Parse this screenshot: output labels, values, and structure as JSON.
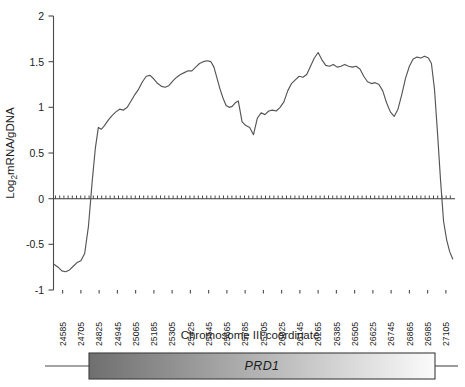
{
  "chart_data": {
    "type": "line",
    "title": "",
    "xlabel": "Chromosome III coordinate",
    "ylabel": "Log2mRNA/gDNA",
    "ylabel_base": "Log",
    "ylabel_sub": "2",
    "ylabel_rest": "mRNA/gDNA",
    "ylim": [
      -1,
      2
    ],
    "yticks": [
      -1,
      -0.5,
      0,
      0.5,
      1,
      1.5,
      2
    ],
    "ytick_labels": [
      "-1",
      "-0.5",
      "0",
      "0.5",
      "1",
      "1.5",
      "2"
    ],
    "xlim": [
      24525,
      27165
    ],
    "xticks": [
      24585,
      24705,
      24825,
      24945,
      25065,
      25185,
      25305,
      25425,
      25545,
      25665,
      25785,
      25905,
      26025,
      26145,
      26265,
      26385,
      26505,
      26625,
      26745,
      26865,
      26985,
      27105
    ],
    "xtick_labels": [
      "24585",
      "24705",
      "24825",
      "24945",
      "25065",
      "25185",
      "25305",
      "25425",
      "25545",
      "25665",
      "25785",
      "25905",
      "26025",
      "26145",
      "26265",
      "26385",
      "26505",
      "26625",
      "26745",
      "26865",
      "26985",
      "27105"
    ],
    "grid": false,
    "legend": null,
    "reference_line": {
      "y": 0,
      "style": "hatched",
      "label": "zero"
    },
    "series": [
      {
        "name": "Log2 mRNA/gDNA ratio",
        "color": "#555555",
        "x": [
          24530,
          24555,
          24580,
          24605,
          24630,
          24655,
          24680,
          24705,
          24730,
          24755,
          24780,
          24800,
          24820,
          24840,
          24860,
          24885,
          24910,
          24935,
          24960,
          24985,
          25010,
          25035,
          25060,
          25085,
          25110,
          25135,
          25160,
          25185,
          25210,
          25235,
          25260,
          25285,
          25310,
          25335,
          25360,
          25385,
          25410,
          25435,
          25460,
          25485,
          25510,
          25535,
          25560,
          25580,
          25600,
          25620,
          25640,
          25660,
          25680,
          25700,
          25720,
          25740,
          25765,
          25790,
          25815,
          25840,
          25865,
          25890,
          25915,
          25940,
          25965,
          25990,
          26015,
          26040,
          26065,
          26090,
          26115,
          26140,
          26165,
          26190,
          26215,
          26240,
          26265,
          26290,
          26315,
          26340,
          26365,
          26390,
          26415,
          26440,
          26465,
          26490,
          26515,
          26540,
          26565,
          26590,
          26615,
          26640,
          26665,
          26690,
          26715,
          26740,
          26765,
          26790,
          26815,
          26840,
          26865,
          26890,
          26915,
          26940,
          26965,
          26990,
          27010,
          27030,
          27050,
          27070,
          27090,
          27110,
          27130,
          27150
        ],
        "y": [
          -0.72,
          -0.75,
          -0.79,
          -0.8,
          -0.78,
          -0.74,
          -0.7,
          -0.68,
          -0.6,
          -0.3,
          0.2,
          0.55,
          0.78,
          0.76,
          0.8,
          0.86,
          0.91,
          0.95,
          0.98,
          0.97,
          1.0,
          1.07,
          1.14,
          1.2,
          1.28,
          1.34,
          1.35,
          1.31,
          1.26,
          1.23,
          1.22,
          1.24,
          1.29,
          1.33,
          1.36,
          1.38,
          1.4,
          1.4,
          1.44,
          1.48,
          1.5,
          1.51,
          1.5,
          1.44,
          1.32,
          1.2,
          1.1,
          1.02,
          1.0,
          1.01,
          1.05,
          1.07,
          0.84,
          0.8,
          0.78,
          0.7,
          0.88,
          0.94,
          0.92,
          0.96,
          0.97,
          0.96,
          1.0,
          1.06,
          1.18,
          1.26,
          1.3,
          1.34,
          1.33,
          1.36,
          1.45,
          1.54,
          1.6,
          1.52,
          1.46,
          1.45,
          1.47,
          1.44,
          1.45,
          1.47,
          1.45,
          1.44,
          1.45,
          1.42,
          1.34,
          1.28,
          1.26,
          1.27,
          1.25,
          1.18,
          1.05,
          0.95,
          0.9,
          0.98,
          1.14,
          1.32,
          1.45,
          1.53,
          1.55,
          1.54,
          1.56,
          1.54,
          1.48,
          1.2,
          0.72,
          0.2,
          -0.25,
          -0.45,
          -0.58,
          -0.66
        ]
      }
    ]
  },
  "gene_track": {
    "gene_label": "PRD1",
    "gradient_start_color": "#6f6f6f",
    "gradient_end_color": "#fbfbfb",
    "outline_color": "#3d3d3d",
    "connector_color": "#4a4a4a"
  }
}
